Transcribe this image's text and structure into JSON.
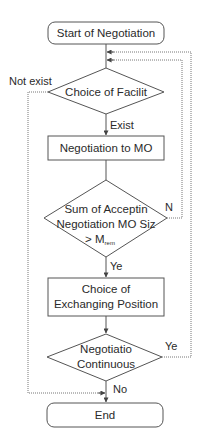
{
  "diagram": {
    "type": "flowchart",
    "nodes": {
      "start": {
        "shape": "terminal",
        "label": "Start of Negotiation"
      },
      "choice_facility": {
        "shape": "decision",
        "label": "Choice of Facilit"
      },
      "negotiation_mo": {
        "shape": "process",
        "label": "Negotiation to MO"
      },
      "sum_check": {
        "shape": "decision",
        "line1": "Sum of Acceptin",
        "line2": "Negotiation MO Siz",
        "line3_prefix": "> M",
        "line3_sub": "rem"
      },
      "choice_exchanging": {
        "shape": "process",
        "line1": "Choice of",
        "line2": "Exchanging Position"
      },
      "negotiation_continuous": {
        "shape": "decision",
        "line1": "Negotiatio",
        "line2": "Continuous"
      },
      "end": {
        "shape": "terminal",
        "label": "End"
      }
    },
    "edge_labels": {
      "not_exist": "Not exist",
      "exist": "Exist",
      "n": "N",
      "ye_sum": "Ye",
      "ye_continue": "Ye",
      "no": "No"
    },
    "edges": [
      {
        "from": "start",
        "to": "choice_facility"
      },
      {
        "from": "choice_facility",
        "to": "negotiation_mo",
        "label": "Exist"
      },
      {
        "from": "choice_facility",
        "to": "end",
        "label": "Not exist"
      },
      {
        "from": "negotiation_mo",
        "to": "sum_check"
      },
      {
        "from": "sum_check",
        "to": "choice_facility",
        "label": "N"
      },
      {
        "from": "sum_check",
        "to": "choice_exchanging",
        "label": "Ye"
      },
      {
        "from": "choice_exchanging",
        "to": "negotiation_continuous"
      },
      {
        "from": "negotiation_continuous",
        "to": "choice_facility",
        "label": "Ye"
      },
      {
        "from": "negotiation_continuous",
        "to": "end",
        "label": "No"
      }
    ]
  }
}
